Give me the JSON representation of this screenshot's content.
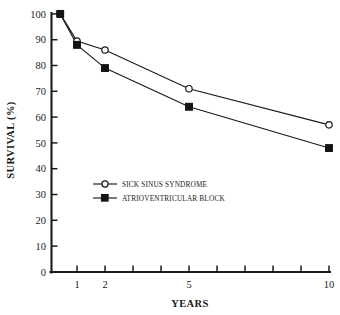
{
  "chart_data": {
    "type": "line",
    "title": "",
    "xlabel": "YEARS",
    "ylabel": "SURVIVAL (%)",
    "x": [
      0.4,
      1,
      2,
      5,
      10
    ],
    "xlim": [
      0.4,
      10
    ],
    "ylim": [
      0,
      100
    ],
    "grid": false,
    "legend_position": "center-left inside plot",
    "xtick_positions": [
      1,
      2,
      3,
      4,
      5,
      6,
      7,
      8,
      9,
      10
    ],
    "xtick_labels_shown": [
      "1",
      "2",
      "5",
      "10"
    ],
    "xtick_labels_values": [
      1,
      2,
      5,
      10
    ],
    "ytick_labels": [
      "0",
      "10",
      "20",
      "30",
      "40",
      "50",
      "60",
      "70",
      "80",
      "90",
      "100"
    ],
    "ytick_values": [
      0,
      10,
      20,
      30,
      40,
      50,
      60,
      70,
      80,
      90,
      100
    ],
    "series": [
      {
        "name": "SICK SINUS SYNDROME",
        "marker": "open-circle",
        "x": [
          0.4,
          1,
          2,
          5,
          10
        ],
        "values": [
          100,
          89.5,
          86,
          71,
          57
        ]
      },
      {
        "name": "ATRIOVENTRICULAR BLOCK",
        "marker": "filled-square",
        "x": [
          0.4,
          1,
          2,
          5,
          10
        ],
        "values": [
          100,
          88,
          79,
          64,
          48
        ]
      }
    ],
    "colors": {
      "line": "#1a1a1a",
      "marker_fill_open": "#ffffff",
      "marker_fill_closed": "#151515",
      "background": "#ffffff"
    }
  }
}
